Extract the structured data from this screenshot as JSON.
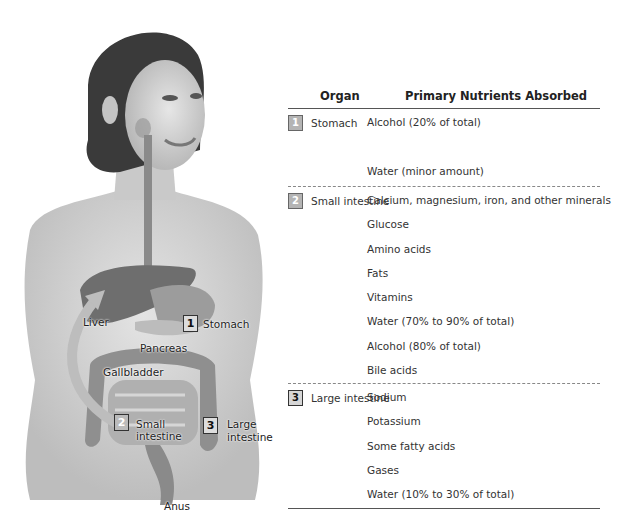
{
  "figure": {
    "labels": {
      "liver": "Liver",
      "stomach": "Stomach",
      "pancreas": "Pancreas",
      "gallbladder": "Gallbladder",
      "small_intestine_line1": "Small",
      "small_intestine_line2": "intestine",
      "large_intestine_line1": "Large",
      "large_intestine_line2": "intestine",
      "anus": "Anus"
    },
    "badges": {
      "stomach": "1",
      "small_intestine": "2",
      "large_intestine": "3"
    }
  },
  "table": {
    "headers": {
      "organ": "Organ",
      "nutrients": "Primary Nutrients Absorbed"
    },
    "rows": [
      {
        "number": "1",
        "organ": "Stomach",
        "nutrients": [
          "Alcohol (20% of total)",
          "",
          "Water (minor amount)"
        ]
      },
      {
        "number": "2",
        "organ": "Small intestine",
        "nutrients": [
          "Calcium, magnesium, iron, and other minerals",
          "Glucose",
          "Amino acids",
          "Fats",
          "Vitamins",
          "Water (70% to 90% of total)",
          "Alcohol (80% of total)",
          "Bile acids"
        ]
      },
      {
        "number": "3",
        "organ": "Large intestine",
        "nutrients": [
          "Sodium",
          "Potassium",
          "Some fatty acids",
          "Gases",
          "Water (10% to 30% of total)"
        ]
      }
    ]
  },
  "colors": {
    "badge_light": "#b4b4b4",
    "badge_dark": "#d6d6d6",
    "rule": "#555555"
  }
}
